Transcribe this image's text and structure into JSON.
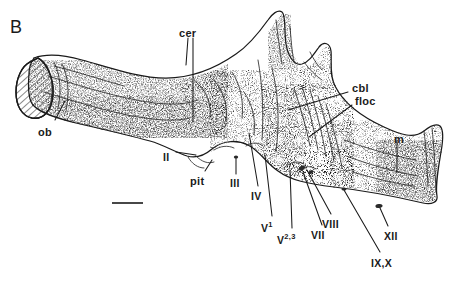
{
  "figure": {
    "panel_label": "B",
    "ink_color": "#1a1a1a",
    "background_color": "#ffffff",
    "stipple_color": "#6b6b6b"
  },
  "scale_bar": {
    "name": "scale-bar",
    "x1": 112,
    "x2": 143,
    "y": 203
  },
  "labels": [
    {
      "id": "cer",
      "text": "cer",
      "x": 179,
      "y": 28,
      "size": "md"
    },
    {
      "id": "ob",
      "text": "ob",
      "x": 38,
      "y": 127,
      "size": "md"
    },
    {
      "id": "cbl",
      "text": "cbl",
      "x": 352,
      "y": 83,
      "size": "md"
    },
    {
      "id": "floc",
      "text": "floc",
      "x": 355,
      "y": 96,
      "size": "md"
    },
    {
      "id": "m",
      "text": "m",
      "x": 394,
      "y": 134,
      "size": "md"
    },
    {
      "id": "II",
      "text": "II",
      "x": 163,
      "y": 152,
      "size": "sm"
    },
    {
      "id": "pit",
      "text": "pit",
      "x": 190,
      "y": 176,
      "size": "md"
    },
    {
      "id": "III",
      "text": "III",
      "x": 230,
      "y": 178,
      "size": "sm"
    },
    {
      "id": "IV",
      "text": "IV",
      "x": 251,
      "y": 191,
      "size": "sm"
    },
    {
      "id": "VIII",
      "text": "VIII",
      "x": 322,
      "y": 219,
      "size": "sm"
    },
    {
      "id": "VII",
      "text": "VII",
      "x": 311,
      "y": 230,
      "size": "sm"
    },
    {
      "id": "XII",
      "text": "XII",
      "x": 384,
      "y": 231,
      "size": "sm"
    },
    {
      "id": "IXX",
      "text": "IX,X",
      "x": 371,
      "y": 258,
      "size": "sm"
    }
  ],
  "superscript_labels": [
    {
      "id": "V1",
      "base": "V",
      "sup": "1",
      "x": 261,
      "y": 221,
      "name": "label-v1"
    },
    {
      "id": "V23",
      "base": "V",
      "sup": "2,3",
      "x": 277,
      "y": 233,
      "name": "label-v23"
    }
  ],
  "leaders": [
    {
      "id": "leader-cer-a",
      "points": "188,38 186,65"
    },
    {
      "id": "leader-cer-b",
      "points": "193,38 193,122"
    },
    {
      "id": "leader-ob",
      "points": "55,120 65,101"
    },
    {
      "id": "leader-cbl",
      "points": "348,92 288,110"
    },
    {
      "id": "leader-floc",
      "points": "352,105 309,137"
    },
    {
      "id": "leader-m",
      "points": "397,140 397,172"
    },
    {
      "id": "leader-II",
      "points": "176,152 196,155"
    },
    {
      "id": "leader-pit",
      "points": "205,171 212,160"
    },
    {
      "id": "leader-III",
      "points": "236,174 236,158"
    },
    {
      "id": "leader-IV",
      "points": "258,186 249,133"
    },
    {
      "id": "leader-V1",
      "points": "272,216 265,155"
    },
    {
      "id": "leader-V23",
      "points": "292,228 290,170"
    },
    {
      "id": "leader-VII",
      "points": "322,225 303,172"
    },
    {
      "id": "leader-VIII",
      "points": "331,214 307,170"
    },
    {
      "id": "leader-XII",
      "points": "388,226 380,208"
    },
    {
      "id": "leader-IXX",
      "points": "380,252 344,190"
    }
  ]
}
